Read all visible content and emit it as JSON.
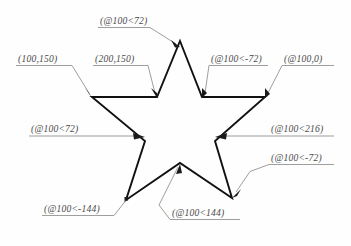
{
  "diagram": {
    "stroke_color": "#111111",
    "leader_color": "#8d8d8d",
    "text_color": "#4a4a4a",
    "background": "#ffffff",
    "shape": {
      "name": "five-pointed-star",
      "points": "180,41 202,97 265,97 215,141 232,198 180,163 126,200 145,141 92,97 157,97"
    },
    "labels": [
      {
        "id": "label-top-apex",
        "name": "label-at-100-lt-72",
        "text": "(@100<72)",
        "x": 100,
        "y": 24,
        "underline": {
          "x1": 98,
          "y1": 27.5,
          "x2": 150,
          "y2": 27.5
        },
        "leader": "150,27.5 176,44",
        "arrow": {
          "x": 179,
          "y": 46,
          "angle": 212
        }
      },
      {
        "id": "label-upper-left",
        "name": "label-at-100-150",
        "text": "(100,150)",
        "x": 18,
        "y": 62,
        "underline": {
          "x1": 16,
          "y1": 65.5,
          "x2": 72,
          "y2": 65.5
        },
        "leader": "72,65.5 89,93",
        "arrow": {
          "x": 91.5,
          "y": 96,
          "angle": 238
        }
      },
      {
        "id": "label-upper-mid",
        "name": "label-at-200-150",
        "text": "(200,150)",
        "x": 95,
        "y": 62,
        "underline": {
          "x1": 93,
          "y1": 65.5,
          "x2": 148,
          "y2": 65.5
        },
        "leader": "148,65.5 156,93",
        "arrow": {
          "x": 157,
          "y": 96,
          "angle": 253
        }
      },
      {
        "id": "label-upper-right",
        "name": "label-at-100-lt-minus-72",
        "text": "(@100<-72)",
        "x": 211,
        "y": 62,
        "underline": {
          "x1": 209,
          "y1": 65.5,
          "x2": 268,
          "y2": 65.5
        },
        "leader": "209,65.5 205,93",
        "arrow": {
          "x": 203.5,
          "y": 96,
          "angle": 285
        }
      },
      {
        "id": "label-far-right",
        "name": "label-at-100-0",
        "text": "(@100,0)",
        "x": 284,
        "y": 62,
        "underline": {
          "x1": 282,
          "y1": 65.5,
          "x2": 334,
          "y2": 65.5
        },
        "leader": "282,65.5 268,93",
        "arrow": {
          "x": 266.5,
          "y": 96,
          "angle": 296
        }
      },
      {
        "id": "label-mid-left",
        "name": "label-at-100-lt-72-left",
        "text": "(@100<72)",
        "x": 31,
        "y": 128,
        "underline": {
          "x1": 29,
          "y1": 136,
          "x2": 141,
          "y2": 136
        },
        "leader": "",
        "arrow": {
          "x": 144,
          "y": 136,
          "angle": 0
        }
      },
      {
        "id": "label-mid-right",
        "name": "label-at-100-lt-216",
        "text": "(@100<216)",
        "x": 271,
        "y": 128,
        "underline": {
          "x1": 334,
          "y1": 136,
          "x2": 219,
          "y2": 136
        },
        "leader": "",
        "arrow": {
          "x": 216,
          "y": 136,
          "angle": 180
        }
      },
      {
        "id": "label-lower-right",
        "name": "label-at-100-lt-minus-72-lower",
        "text": "(@100<-72)",
        "x": 271,
        "y": 161,
        "underline": {
          "x1": 269,
          "y1": 164.5,
          "x2": 334,
          "y2": 164.5
        },
        "leader": "269,164.5 251,172 237,192",
        "arrow": {
          "x": 234,
          "y": 196,
          "angle": 235
        }
      },
      {
        "id": "label-lower-left",
        "name": "label-at-100-lt-minus-144",
        "text": "(@100<-144)",
        "x": 44,
        "y": 212,
        "underline": {
          "x1": 42,
          "y1": 215.5,
          "x2": 114,
          "y2": 215.5
        },
        "leader": "114,215.5 122,205 127,198",
        "arrow": {
          "x": 127,
          "y": 199,
          "angle": 305
        }
      },
      {
        "id": "label-bottom-mid",
        "name": "label-at-100-lt-144",
        "text": "(@100<144)",
        "x": 172,
        "y": 216,
        "underline": {
          "x1": 170,
          "y1": 219.5,
          "x2": 240,
          "y2": 219.5
        },
        "leader": "170,219.5 160,206 178,167",
        "arrow": {
          "x": 179,
          "y": 165,
          "angle": 290
        }
      }
    ]
  }
}
